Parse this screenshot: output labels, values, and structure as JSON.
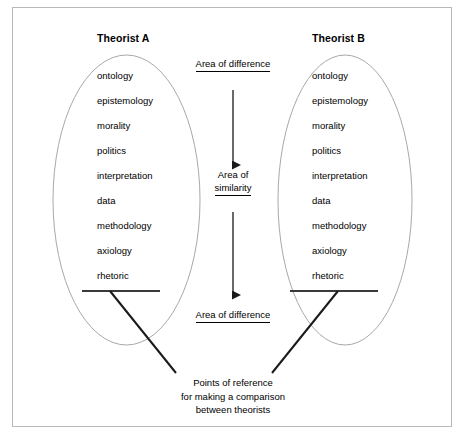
{
  "figure": {
    "frame_border_color": "#b9b9b9",
    "background_color": "#ffffff",
    "ellipse_stroke_color": "#a8a8a8",
    "line_color": "#1a1a1a"
  },
  "theorists": [
    {
      "id": "a",
      "title": "Theorist A",
      "concepts": [
        "ontology",
        "epistemology",
        "morality",
        "politics",
        "interpretation",
        "data",
        "methodology",
        "axiology",
        "rhetoric"
      ]
    },
    {
      "id": "b",
      "title": "Theorist B",
      "concepts": [
        "ontology",
        "epistemology",
        "morality",
        "politics",
        "interpretation",
        "data",
        "methodology",
        "axiology",
        "rhetoric"
      ]
    }
  ],
  "middle": {
    "difference_top_label": "Area of difference",
    "similarity_label_line1": "Area of",
    "similarity_label_line2": "similarity",
    "difference_bottom_label": "Area of difference"
  },
  "caption": {
    "line1": "Points of reference",
    "line2": "for making a comparison",
    "line3": "between theorists"
  }
}
